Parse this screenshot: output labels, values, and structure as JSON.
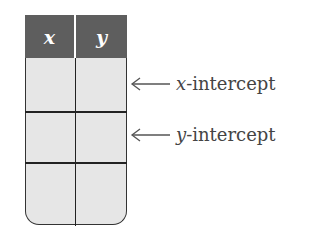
{
  "table": {
    "headers": [
      "x",
      "y"
    ],
    "rows": [
      [
        "",
        ""
      ],
      [
        "",
        ""
      ],
      [
        "",
        ""
      ]
    ],
    "header_color": "#5e5e5e",
    "cell_color": "#e6e6e6"
  },
  "annotations": [
    {
      "row": 0,
      "var": "x",
      "suffix": "-intercept",
      "icon": "left-arrow-icon"
    },
    {
      "row": 1,
      "var": "y",
      "suffix": "-intercept",
      "icon": "left-arrow-icon"
    }
  ]
}
